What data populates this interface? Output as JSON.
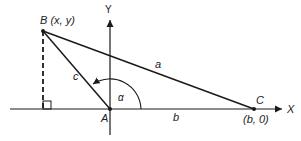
{
  "diagram": {
    "type": "geometry-triangle-coordinates",
    "axes": {
      "x_label": "X",
      "y_label": "Y"
    },
    "points": {
      "A": {
        "label": "A"
      },
      "B": {
        "label": "B (x, y)"
      },
      "C": {
        "label": "C",
        "coord_label": "(b, 0)"
      }
    },
    "sides": {
      "a": "a",
      "b": "b",
      "c": "c"
    },
    "angle": {
      "label": "α"
    },
    "colors": {
      "line": "#1a1a1a",
      "background": "#ffffff"
    }
  }
}
